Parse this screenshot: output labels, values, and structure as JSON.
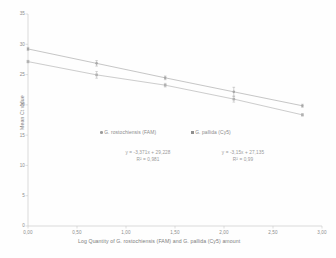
{
  "chart_data": {
    "type": "scatter",
    "title": "",
    "xlabel": "Log Quantity of G. rostochiensis (FAM) and G. pallida (Cy5) amount",
    "ylabel": "Mean Ct value",
    "xlim": [
      0,
      3
    ],
    "ylim": [
      0,
      35
    ],
    "xticks": [
      "0,00",
      "0,50",
      "1,00",
      "1,50",
      "2,00",
      "2,50",
      "3,00"
    ],
    "xtick_values": [
      0,
      0.5,
      1.0,
      1.5,
      2.0,
      2.5,
      3.0
    ],
    "yticks": [
      "0",
      "5",
      "10",
      "15",
      "20",
      "25",
      "30",
      "35"
    ],
    "ytick_values": [
      0,
      5,
      10,
      15,
      20,
      25,
      30,
      35
    ],
    "grid": false,
    "legend_position": "inside-middle",
    "series": [
      {
        "name": "G. rostochiensis (FAM)",
        "marker": "circle",
        "color": "#8f8f8f",
        "x": [
          0.0,
          0.7,
          1.4,
          2.1,
          2.8
        ],
        "y": [
          29.23,
          26.85,
          24.46,
          22.15,
          19.85
        ],
        "yerr": [
          0.25,
          0.45,
          0.3,
          0.75,
          0.25
        ],
        "equation": "y = -3,371x + 29,228",
        "r2": "R² = 0,981"
      },
      {
        "name": "G. pallida (Cy5)",
        "marker": "square",
        "color": "#9c9c9c",
        "x": [
          0.0,
          0.7,
          1.4,
          2.1,
          2.8
        ],
        "y": [
          27.14,
          24.95,
          23.25,
          20.95,
          18.35
        ],
        "yerr": [
          0.2,
          0.55,
          0.3,
          0.5,
          0.2
        ],
        "equation": "y = -3,15x + 27,135",
        "r2": "R² = 0,99"
      }
    ],
    "annotations": [
      {
        "text": "y = -3,371x + 29,228",
        "x": 1.0,
        "y": 12.8
      },
      {
        "text": "R² = 0,981",
        "x": 1.0,
        "y": 11.4
      },
      {
        "text": "y = -3,15x + 27,135",
        "x": 2.15,
        "y": 12.8
      },
      {
        "text": "R² = 0,99",
        "x": 2.15,
        "y": 11.4
      }
    ]
  },
  "axes": {
    "y_title": "Mean Ct value",
    "x_title": "Log Quantity of G. rostochiensis (FAM) and G. pallida (Cy5) amount",
    "x_tick_labels": [
      "0,00",
      "0,50",
      "1,00",
      "1,50",
      "2,00",
      "2,50",
      "3,00"
    ],
    "y_tick_labels": [
      "0",
      "5",
      "10",
      "15",
      "20",
      "25",
      "30",
      "35"
    ]
  },
  "legend": {
    "entries": [
      {
        "label": "G. rostochiensis (FAM)",
        "marker": "circle"
      },
      {
        "label": "G. pallida (Cy5)",
        "marker": "square"
      }
    ]
  },
  "equations": {
    "left_eq": "y = -3,371x + 29,228",
    "left_r2": "R² = 0,981",
    "right_eq": "y = -3,15x + 27,135",
    "right_r2": "R² = 0,99"
  },
  "colors": {
    "series1": "#8f8f8f",
    "series2": "#9c9c9c",
    "axis": "#b5b5b5",
    "text": "#8a8a8a"
  }
}
